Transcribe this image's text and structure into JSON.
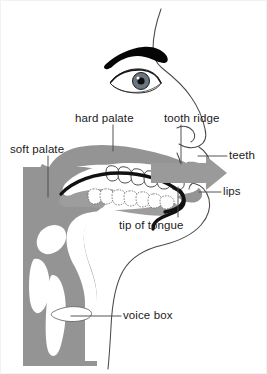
{
  "figure": {
    "type": "anatomical-diagram",
    "view": "left-facing side profile, sagittal section",
    "colors": {
      "background": "#ffffff",
      "tissue_gray": "#949494",
      "tissue_gray_light": "#9d9d9d",
      "airflow_arrow": "#9a9a9a",
      "outline": "#3a3a3a",
      "tongue": "#111111",
      "eyebrow": "#050505",
      "label_text": "#1a1a1a",
      "leader_line": "#4a4a4a",
      "cavity_white": "#ffffff"
    }
  },
  "labels": {
    "soft_palate": "soft palate",
    "hard_palate": "hard palate",
    "tooth_ridge": "tooth ridge",
    "teeth": "teeth",
    "lips": "lips",
    "tip_of_tongue": "tip of tongue",
    "voice_box": "voice box"
  },
  "parts": [
    {
      "id": "soft-palate",
      "label": "soft palate",
      "region": "velum, rear roof of mouth"
    },
    {
      "id": "hard-palate",
      "label": "hard palate",
      "region": "bony roof of mouth"
    },
    {
      "id": "tooth-ridge",
      "label": "tooth ridge",
      "region": "alveolar ridge behind upper teeth"
    },
    {
      "id": "teeth",
      "label": "teeth",
      "region": "upper and lower dentition"
    },
    {
      "id": "lips",
      "label": "lips",
      "region": "upper and lower lips"
    },
    {
      "id": "tip-of-tongue",
      "label": "tip of tongue",
      "region": "apex of tongue"
    },
    {
      "id": "voice-box",
      "label": "voice box",
      "region": "larynx in the neck"
    }
  ],
  "features": {
    "airflow_arrow": "gray arrow pointing right out through the lips",
    "face_profile": "forehead, nose and chin outline facing right",
    "eye": "single right-facing eye with dark eyebrow"
  }
}
